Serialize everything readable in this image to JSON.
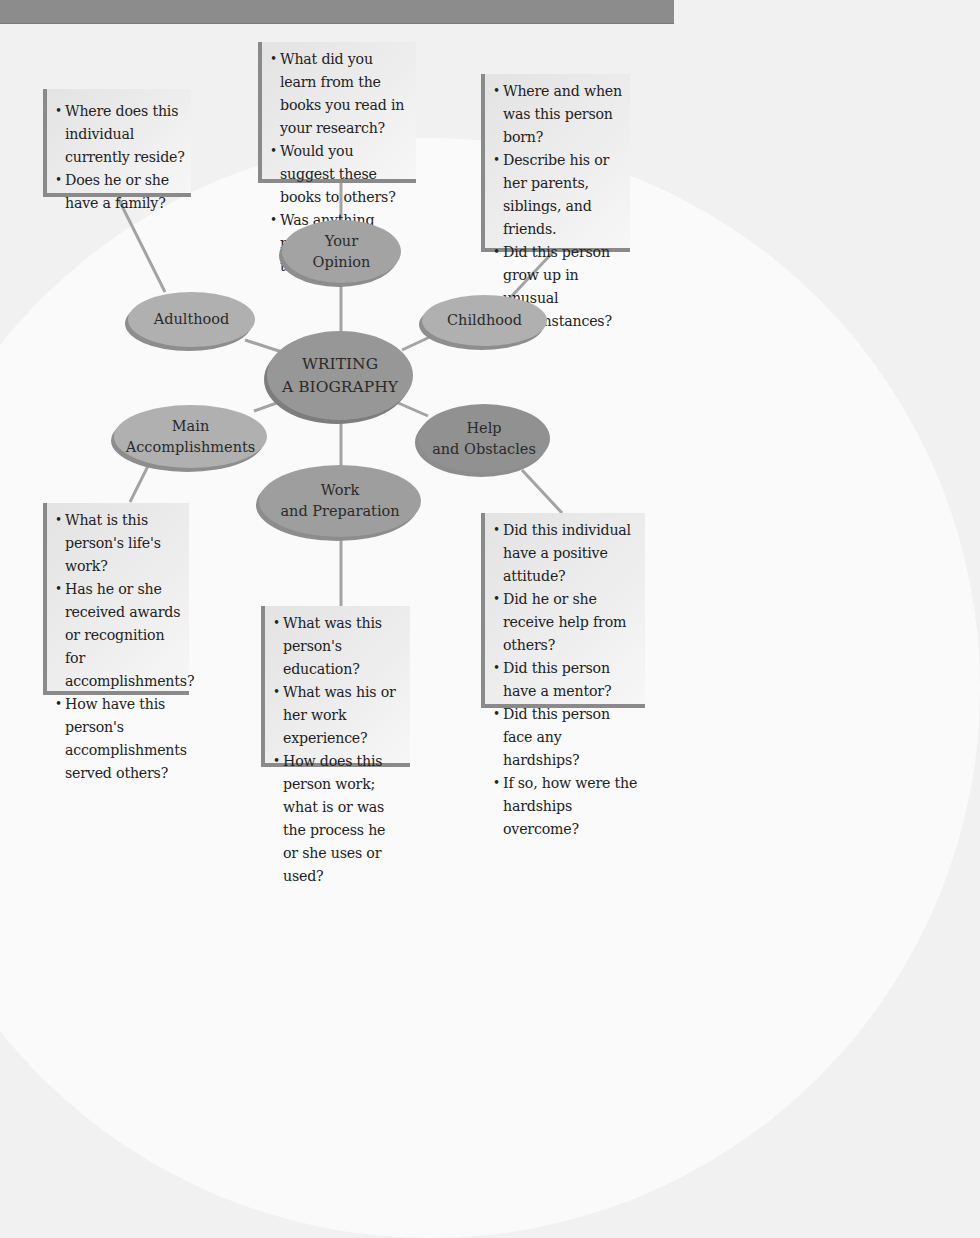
{
  "diagram": {
    "center": {
      "line1": "WRITING",
      "line2": "A BIOGRAPHY"
    },
    "nodes": {
      "opinion": {
        "line1": "Your",
        "line2": "Opinion"
      },
      "adulthood": {
        "line1": "Adulthood"
      },
      "childhood": {
        "line1": "Childhood"
      },
      "accomplishments": {
        "line1": "Main",
        "line2": "Accomplishments"
      },
      "help": {
        "line1": "Help",
        "line2": "and Obstacles"
      },
      "work": {
        "line1": "Work",
        "line2": "and Preparation"
      }
    },
    "boxes": {
      "opinion": [
        "What did you learn from the books you read in your research?",
        "Would you suggest these books to others?",
        "Was anything missing from these books?"
      ],
      "adulthood": [
        "Where does this individual currently reside?",
        "Does he or she have a family?"
      ],
      "childhood": [
        "Where and when was this person born?",
        "Describe his or her parents, siblings, and friends.",
        "Did this person grow up in unusual circumstances?"
      ],
      "accomplishments": [
        "What is this person's life's work?",
        "Has he or she received awards or recognition for accomplishments?",
        "How have this person's accomplishments served others?"
      ],
      "work": [
        "What was this person's education?",
        "What was his or her work experience?",
        "How does this person work; what is or was the process he or she uses or used?"
      ],
      "help": [
        "Did this individual have a positive attitude?",
        "Did he or she receive help from others?",
        "Did this person have a mentor?",
        "Did this person face any hardships?",
        "If so, how were the hardships overcome?"
      ]
    },
    "colors": {
      "header": "#8c8c8c",
      "node_light": "#b0b0b0",
      "node_dark": "#919191",
      "center": "#979797",
      "connector": "#a0a0a0"
    }
  }
}
